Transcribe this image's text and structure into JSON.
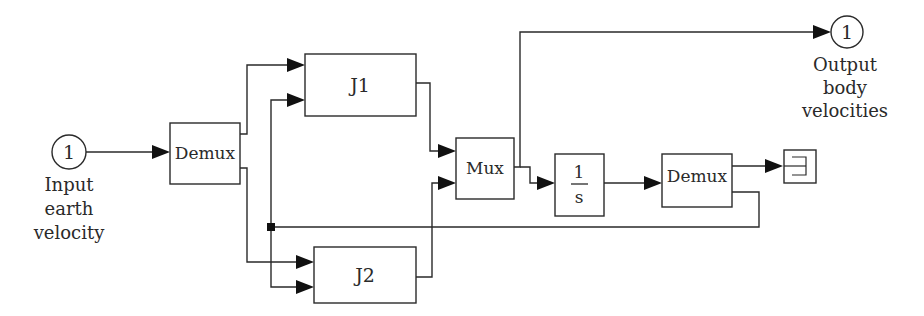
{
  "diagram": {
    "type": "simulink-block-diagram",
    "colors": {
      "line": "#2a2a2a",
      "arrow": "#111111",
      "background": "#ffffff"
    },
    "input_port": {
      "number": "1",
      "label_lines": [
        "Input",
        "earth",
        "velocity"
      ]
    },
    "output_port": {
      "number": "1",
      "label_lines": [
        "Output",
        "body",
        "velocities"
      ]
    },
    "blocks": {
      "demux1": {
        "label": "Demux"
      },
      "j1": {
        "label": "J1"
      },
      "j2": {
        "label": "J2"
      },
      "mux": {
        "label": "Mux"
      },
      "integrator": {
        "numerator": "1",
        "denominator": "s"
      },
      "demux2": {
        "label": "Demux"
      },
      "terminator": {
        "icon": "terminator-icon"
      }
    },
    "connections": [
      {
        "from": "input_port",
        "to": "demux1"
      },
      {
        "from": "demux1.out1",
        "to": "j1.in1"
      },
      {
        "from": "demux1.out2",
        "to": "j2.in1"
      },
      {
        "from": "demux2.out2 (branch)",
        "to": "j1.in2"
      },
      {
        "from": "demux2.out2 (branch)",
        "to": "j2.in2"
      },
      {
        "from": "j1",
        "to": "mux.in1"
      },
      {
        "from": "j2",
        "to": "mux.in2"
      },
      {
        "from": "mux",
        "to": "output_port"
      },
      {
        "from": "mux",
        "to": "integrator"
      },
      {
        "from": "integrator",
        "to": "demux2"
      },
      {
        "from": "demux2.out1",
        "to": "terminator"
      }
    ]
  }
}
